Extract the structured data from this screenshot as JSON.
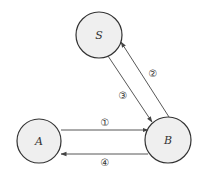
{
  "diagram": {
    "nodes": [
      {
        "id": "S",
        "label": "S"
      },
      {
        "id": "A",
        "label": "A"
      },
      {
        "id": "B",
        "label": "B"
      }
    ],
    "edges": [
      {
        "from": "A",
        "to": "B",
        "label": "①"
      },
      {
        "from": "B",
        "to": "S",
        "label": "②"
      },
      {
        "from": "S",
        "to": "B",
        "label": "③"
      },
      {
        "from": "B",
        "to": "A",
        "label": "④"
      }
    ]
  }
}
